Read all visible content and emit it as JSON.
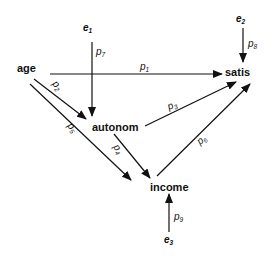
{
  "diagram": {
    "type": "path-diagram",
    "nodes": [
      {
        "id": "age",
        "label": "age"
      },
      {
        "id": "autonom",
        "label": "autonom"
      },
      {
        "id": "income",
        "label": "income"
      },
      {
        "id": "satis",
        "label": "satis"
      }
    ],
    "errors": [
      {
        "id": "e1",
        "base": "e",
        "sub": "1"
      },
      {
        "id": "e2",
        "base": "e",
        "sub": "2"
      },
      {
        "id": "e3",
        "base": "e",
        "sub": "3"
      }
    ],
    "paths": [
      {
        "id": "p1",
        "base": "p",
        "sub": "1",
        "from": "age",
        "to": "satis"
      },
      {
        "id": "p2",
        "base": "p",
        "sub": "2",
        "from": "age",
        "to": "autonom"
      },
      {
        "id": "p3",
        "base": "p",
        "sub": "3",
        "from": "autonom",
        "to": "satis"
      },
      {
        "id": "p5",
        "base": "p",
        "sub": "5",
        "from": "age",
        "to": "income"
      },
      {
        "id": "p4",
        "base": "p",
        "sub": "4",
        "from": "autonom",
        "to": "income"
      },
      {
        "id": "p6",
        "base": "p",
        "sub": "6",
        "from": "income",
        "to": "satis"
      },
      {
        "id": "p7",
        "base": "p",
        "sub": "7",
        "from": "e1",
        "to": "autonom"
      },
      {
        "id": "p8",
        "base": "p",
        "sub": "8",
        "from": "e2",
        "to": "satis"
      },
      {
        "id": "p9",
        "base": "p",
        "sub": "9",
        "from": "e3",
        "to": "income"
      }
    ]
  }
}
